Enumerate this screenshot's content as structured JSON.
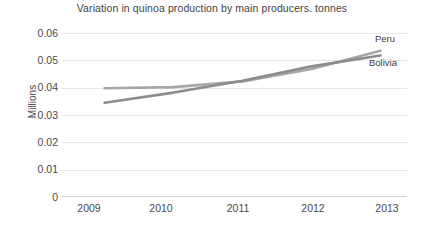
{
  "chart_data": {
    "type": "line",
    "title": "Variation in quinoa production by main producers. tonnes",
    "xlabel": "",
    "ylabel": "Millions",
    "categories": [
      "2009",
      "2010",
      "2011",
      "2012",
      "2013"
    ],
    "x": [
      2009,
      2010,
      2011,
      2012,
      2013
    ],
    "series": [
      {
        "name": "Peru",
        "values": [
          0.0398,
          0.0402,
          0.0423,
          0.0468,
          0.0535
        ],
        "color": "#a6a6a6",
        "label_position": "right-end-top"
      },
      {
        "name": "Bolivia",
        "values": [
          0.0345,
          0.0382,
          0.0425,
          0.0478,
          0.0518
        ],
        "color": "#8c8c8c",
        "label_position": "right-end-bottom"
      }
    ],
    "ylim": [
      0,
      0.06
    ],
    "yticks": [
      "0.06",
      "0.05",
      "0.04",
      "0.03",
      "0.02",
      "0.01",
      "0"
    ],
    "ytick_values": [
      0.06,
      0.05,
      0.04,
      0.03,
      0.02,
      0.01,
      0
    ],
    "grid": true,
    "gridline_color": "#e6e6e6",
    "legend": "inline-end-labels",
    "background": "#ffffff"
  },
  "labels": {
    "peru": "Peru",
    "bolivia": "Bolivia"
  }
}
